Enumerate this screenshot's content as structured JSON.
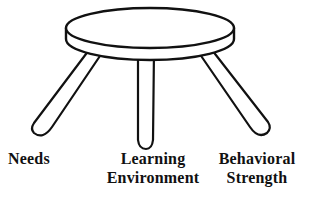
{
  "diagram": {
    "background_color": "#ffffff",
    "stroke_color": "#111111",
    "fill_color": "#ffffff",
    "stroke_width": 2.2,
    "parts": {
      "seat_top": "seat-top-ellipse",
      "seat_rim": "seat-side-rim",
      "leg_left": "left-leg",
      "leg_center": "center-leg",
      "leg_right": "right-leg"
    }
  },
  "labels": {
    "left": {
      "text": "Needs",
      "lines": [
        "Needs"
      ],
      "align": "left"
    },
    "center": {
      "text": "Learning\nEnvironment",
      "lines": [
        "Learning",
        "Environment"
      ],
      "align": "center"
    },
    "right": {
      "text": "Behavioral\nStrength",
      "lines": [
        "Behavioral",
        "Strength"
      ],
      "align": "center"
    }
  }
}
